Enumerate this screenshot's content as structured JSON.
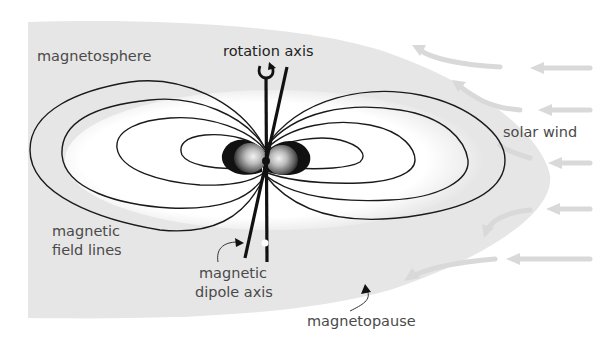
{
  "diagram": {
    "labels": {
      "magnetosphere": "magnetosphere",
      "rotation_axis": "rotation axis",
      "solar_wind": "solar wind",
      "field_lines_1": "magnetic",
      "field_lines_2": "field lines",
      "dipole_axis_1": "magnetic",
      "dipole_axis_2": "dipole axis",
      "magnetopause": "magnetopause"
    },
    "colors": {
      "background": "#ffffff",
      "magnetosphere_fill": "#e6e6e6",
      "inner_glow": "#ffffff",
      "field_line": "#1a1a1a",
      "solar_wind_arrow": "#d9d9d9",
      "label_text": "#4a4a4a",
      "earth_dark": "#111111",
      "earth_mid": "#777777",
      "earth_light": "#dddddd"
    },
    "icons": {
      "rotation": "rotation-arrow-icon",
      "pointer": "curved-pointer-arrow-icon"
    }
  }
}
